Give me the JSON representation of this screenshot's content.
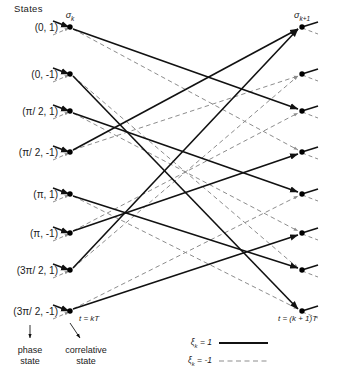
{
  "figure": {
    "title": "States",
    "type": "trellis-diagram"
  },
  "columns": {
    "left": {
      "header": "σ",
      "header_sub": "k",
      "time_label": "t = kT",
      "x": 70
    },
    "right": {
      "header": "σ",
      "header_sub": "k+1",
      "time_label": "t = (k + 1)T",
      "x": 302
    }
  },
  "states": [
    {
      "label": "(0, 1)",
      "phase": "0",
      "correlative": "1",
      "y": 27
    },
    {
      "label": "(0, -1)",
      "phase": "0",
      "correlative": "-1",
      "y": 74
    },
    {
      "label": "(π/ 2, 1)",
      "phase": "π/2",
      "correlative": "1",
      "y": 111
    },
    {
      "label": "(π/ 2, -1)",
      "phase": "π/2",
      "correlative": "-1",
      "y": 152
    },
    {
      "label": "(π, 1)",
      "phase": "π",
      "correlative": "1",
      "y": 194
    },
    {
      "label": "(π, -1)",
      "phase": "π",
      "correlative": "-1",
      "y": 233
    },
    {
      "label": "(3π/ 2, 1)",
      "phase": "3π/2",
      "correlative": "1",
      "y": 270
    },
    {
      "label": "(3π/ 2, -1)",
      "phase": "3π/2",
      "correlative": "-1",
      "y": 311
    }
  ],
  "transitions": [
    {
      "from": 0,
      "to": 2,
      "branch": "1"
    },
    {
      "from": 0,
      "to": 3,
      "branch": "-1"
    },
    {
      "from": 1,
      "to": 7,
      "branch": "1"
    },
    {
      "from": 1,
      "to": 6,
      "branch": "-1"
    },
    {
      "from": 2,
      "to": 4,
      "branch": "1"
    },
    {
      "from": 2,
      "to": 5,
      "branch": "-1"
    },
    {
      "from": 3,
      "to": 0,
      "branch": "1"
    },
    {
      "from": 3,
      "to": 1,
      "branch": "-1"
    },
    {
      "from": 4,
      "to": 6,
      "branch": "1"
    },
    {
      "from": 4,
      "to": 7,
      "branch": "-1"
    },
    {
      "from": 5,
      "to": 3,
      "branch": "1"
    },
    {
      "from": 5,
      "to": 2,
      "branch": "-1"
    },
    {
      "from": 6,
      "to": 0,
      "branch": "1"
    },
    {
      "from": 6,
      "to": 1,
      "branch": "-1"
    },
    {
      "from": 7,
      "to": 5,
      "branch": "1"
    },
    {
      "from": 7,
      "to": 4,
      "branch": "-1"
    }
  ],
  "annotations": [
    {
      "name": "phase-state",
      "line1": "phase",
      "line2": "state",
      "x": 30,
      "y": 345,
      "arrow_from_x": 30,
      "arrow_from_y": 325,
      "arrow_to_x": 30,
      "arrow_to_y": 338
    },
    {
      "name": "correlative-state",
      "line1": "correlative",
      "line2": "state",
      "x": 86,
      "y": 345,
      "arrow_from_x": 70,
      "arrow_from_y": 323,
      "arrow_to_x": 80,
      "arrow_to_y": 338
    }
  ],
  "legend": {
    "entries": [
      {
        "label": "ξ",
        "sub": "k",
        "value": " = 1",
        "style": "solid",
        "y": 343
      },
      {
        "label": "ξ",
        "sub": "k",
        "value": " = -1",
        "style": "dashed",
        "y": 361
      }
    ],
    "label_x": 212,
    "line_x1": 219,
    "line_x2": 268
  },
  "colors": {
    "solid_stroke": "#111111",
    "dashed_stroke": "#8d8d8d",
    "node_fill": "#000000",
    "text": "#1a1a1a",
    "background": "#ffffff"
  }
}
